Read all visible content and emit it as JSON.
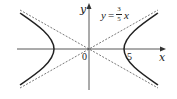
{
  "diagram": {
    "type": "hyperbola-with-asymptotes",
    "x_axis_label": "x",
    "y_axis_label": "y",
    "origin_label": "0",
    "vertex_label": "5",
    "asymptote_equation": {
      "lhs": "y",
      "equals": "=",
      "numerator": "3",
      "denominator": "5",
      "variable": "x"
    },
    "colors": {
      "curve": "#222222",
      "axis": "#444444",
      "asymptote": "#555555"
    }
  }
}
